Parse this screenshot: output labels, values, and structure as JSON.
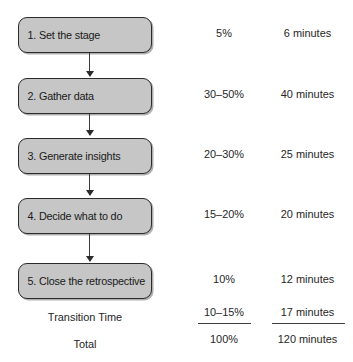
{
  "diagram": {
    "type": "flowchart-with-table",
    "title": "",
    "columns": [
      "Step",
      "Percentage",
      "Duration"
    ],
    "steps": [
      {
        "label": "1. Set the stage",
        "percent": "5%",
        "duration": "6 minutes"
      },
      {
        "label": "2. Gather data",
        "percent": "30–50%",
        "duration": "40 minutes"
      },
      {
        "label": "3. Generate insights",
        "percent": "20–30%",
        "duration": "25 minutes"
      },
      {
        "label": "4. Decide what to do",
        "percent": "15–20%",
        "duration": "20 minutes"
      },
      {
        "label": "5. Close the retrospective",
        "percent": "10%",
        "duration": "12 minutes"
      }
    ],
    "summary": [
      {
        "label": "Transition Time",
        "percent": "10–15%",
        "duration": "17 minutes",
        "underlined": true
      },
      {
        "label": "Total",
        "percent": "100%",
        "duration": "120 minutes",
        "underlined": false
      }
    ],
    "colors": {
      "box_fill": "#c6c6c6",
      "box_border": "#2b2b2b",
      "text": "#1a1a1a",
      "connector": "#3a3a3a",
      "background": "#ffffff"
    }
  }
}
